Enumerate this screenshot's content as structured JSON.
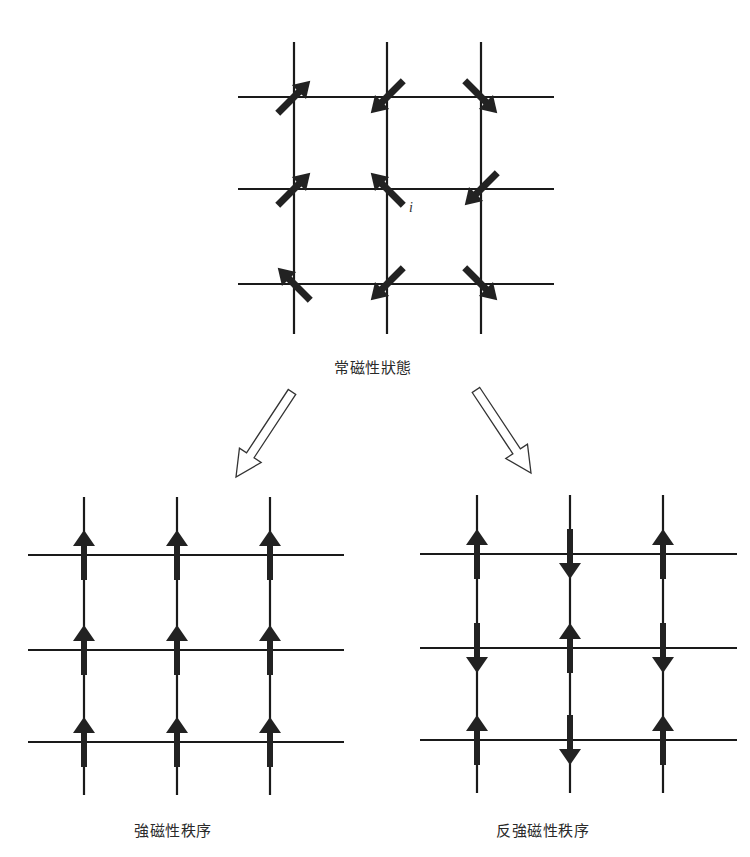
{
  "diagram": {
    "colors": {
      "line": "#1a1a1a",
      "arrow": "#222222",
      "background": "#ffffff"
    },
    "panels": {
      "paramagnetic": {
        "label": "常磁性狀態",
        "site_label": "i",
        "grid": {
          "x": [
            294,
            387,
            481
          ],
          "y": [
            97,
            189,
            284
          ],
          "x_range": [
            238,
            554
          ],
          "y_range": [
            42,
            334
          ]
        },
        "spins_deg": [
          [
            45,
            225,
            135
          ],
          [
            45,
            315,
            225
          ],
          [
            315,
            225,
            135
          ]
        ]
      },
      "ferromagnetic": {
        "label": "強磁性秩序",
        "grid": {
          "x": [
            84,
            177,
            270
          ],
          "y": [
            555,
            650,
            742
          ],
          "x_range": [
            28,
            344
          ],
          "y_range": [
            497,
            795
          ]
        },
        "spins": [
          [
            "up",
            "up",
            "up"
          ],
          [
            "up",
            "up",
            "up"
          ],
          [
            "up",
            "up",
            "up"
          ]
        ]
      },
      "antiferromagnetic": {
        "label": "反強磁性秩序",
        "grid": {
          "x": [
            477,
            570,
            663
          ],
          "y": [
            554,
            648,
            740
          ],
          "x_range": [
            420,
            737
          ],
          "y_range": [
            495,
            793
          ]
        },
        "spins": [
          [
            "up",
            "down",
            "up"
          ],
          [
            "down",
            "up",
            "down"
          ],
          [
            "up",
            "down",
            "up"
          ]
        ]
      }
    },
    "transition_arrows": [
      {
        "name": "to-ferromagnetic",
        "from": [
          292,
          392
        ],
        "to": [
          236,
          477
        ]
      },
      {
        "name": "to-antiferromagnetic",
        "from": [
          476,
          390
        ],
        "to": [
          531,
          473
        ]
      }
    ]
  }
}
